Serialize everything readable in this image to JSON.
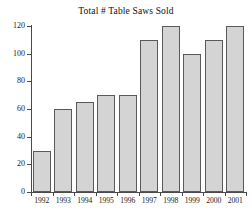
{
  "chart_data": {
    "type": "bar",
    "title": "Total # Table Saws Sold",
    "xlabel": "",
    "ylabel": "",
    "categories": [
      "1992",
      "1993",
      "1994",
      "1995",
      "1996",
      "1997",
      "1998",
      "1999",
      "2000",
      "2001"
    ],
    "values": [
      30,
      60,
      65,
      70,
      70,
      110,
      120,
      100,
      110,
      120
    ],
    "ylim": [
      0,
      120
    ],
    "yticks": [
      0,
      20,
      40,
      60,
      80,
      100,
      120
    ],
    "ytick_labels": [
      "0",
      "20",
      "40",
      "60",
      "80",
      "100",
      "120"
    ],
    "grid": false,
    "legend": null,
    "bar_color": "#d4d4d4",
    "bar_border_color": "#5a5a5a",
    "axis_color": "#4a4a4a",
    "background": "#ffffff"
  }
}
